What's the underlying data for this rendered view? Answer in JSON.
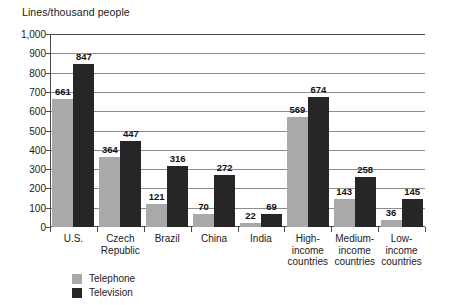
{
  "chart_data": {
    "type": "bar",
    "title": "",
    "ylabel": "Lines/thousand people",
    "xlabel": "",
    "ylim": [
      0,
      1000
    ],
    "yticks": [
      "0",
      "100",
      "200",
      "300",
      "400",
      "500",
      "600",
      "700",
      "800",
      "900",
      "1,000"
    ],
    "grid": true,
    "legend_position": "bottom-left",
    "categories": [
      "U.S.",
      "Czech\nRepublic",
      "Brazil",
      "China",
      "India",
      "High-\nincome\ncountries",
      "Medium-\nincome\ncountries",
      "Low-\nincome\ncountries"
    ],
    "series": [
      {
        "name": "Telephone",
        "color": "#a9a9a9",
        "values": [
          661,
          364,
          121,
          70,
          22,
          569,
          143,
          36
        ]
      },
      {
        "name": "Television",
        "color": "#262626",
        "values": [
          847,
          447,
          316,
          272,
          69,
          674,
          258,
          145
        ]
      }
    ]
  },
  "legend": {
    "items": [
      {
        "label": "Telephone",
        "key": "telephone"
      },
      {
        "label": "Television",
        "key": "television"
      }
    ]
  }
}
